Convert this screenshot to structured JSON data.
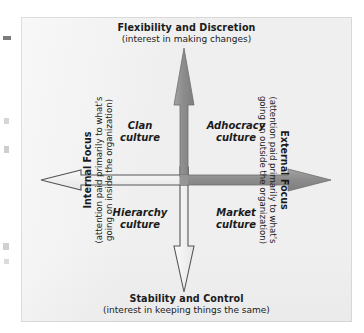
{
  "figure": {
    "type": "competing-values-framework-quadrant-diagram",
    "background_color": "#efefef",
    "axes": {
      "top": {
        "title": "Flexibility and Discretion",
        "subtitle": "(interest in making changes)",
        "arrow": {
          "direction": "up",
          "fill": "#8f8f8f",
          "style": "filled"
        }
      },
      "bottom": {
        "title": "Stability and Control",
        "subtitle": "(interest in keeping things the same)",
        "arrow": {
          "direction": "down",
          "fill": "#f5f5f5",
          "style": "outlined"
        }
      },
      "left": {
        "title": "Internal Focus",
        "subtitle": "(attention paid primarily to what's going on inside the organization)",
        "subtitle_line1": "(attention paid primarily to what's",
        "subtitle_line2": "going on inside the organization)",
        "arrow": {
          "direction": "left",
          "fill": "#f5f5f5",
          "style": "outlined"
        }
      },
      "right": {
        "title": "External Focus",
        "subtitle": "(attention paid primarily to what's going on outside the organization)",
        "subtitle_line1": "(attention paid primarily to what's",
        "subtitle_line2": "going on outside the organization)",
        "arrow": {
          "direction": "right",
          "fill": "#8f8f8f",
          "style": "filled"
        }
      }
    },
    "quadrants": [
      {
        "id": "clan",
        "position": "top-left",
        "line1": "Clan",
        "line2": "culture"
      },
      {
        "id": "adhocracy",
        "position": "top-right",
        "line1": "Adhocracy",
        "line2": "culture"
      },
      {
        "id": "hierarchy",
        "position": "bottom-left",
        "line1": "Hierarchy",
        "line2": "culture"
      },
      {
        "id": "market",
        "position": "bottom-right",
        "line1": "Market",
        "line2": "culture"
      }
    ],
    "colors": {
      "arrow_fill_gray": "#8f8f8f",
      "arrow_fill_white": "#f5f5f5",
      "arrow_outline": "#4a4a4a",
      "text": "#1b1b1b",
      "panel": "#efefef"
    }
  }
}
